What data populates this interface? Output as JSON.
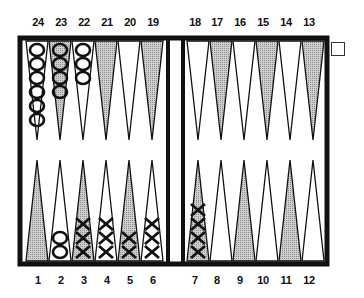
{
  "game": "backgammon",
  "colors": {
    "frame": "#111111",
    "shaded_point": "#b8b8b8",
    "light_point": "#ffffff",
    "checker_stroke": "#111111"
  },
  "top_labels": [
    "24",
    "23",
    "22",
    "21",
    "20",
    "19",
    "18",
    "17",
    "16",
    "15",
    "14",
    "13"
  ],
  "bottom_labels": [
    "1",
    "2",
    "3",
    "4",
    "5",
    "6",
    "7",
    "8",
    "9",
    "10",
    "11",
    "12"
  ],
  "points": {
    "1": {
      "shaded": true,
      "checkers": 0,
      "type": ""
    },
    "2": {
      "shaded": false,
      "checkers": 2,
      "type": "O"
    },
    "3": {
      "shaded": true,
      "checkers": 3,
      "type": "X"
    },
    "4": {
      "shaded": false,
      "checkers": 3,
      "type": "X"
    },
    "5": {
      "shaded": true,
      "checkers": 2,
      "type": "X"
    },
    "6": {
      "shaded": false,
      "checkers": 3,
      "type": "X"
    },
    "7": {
      "shaded": true,
      "checkers": 4,
      "type": "X"
    },
    "8": {
      "shaded": false,
      "checkers": 0,
      "type": ""
    },
    "9": {
      "shaded": true,
      "checkers": 0,
      "type": ""
    },
    "10": {
      "shaded": false,
      "checkers": 0,
      "type": ""
    },
    "11": {
      "shaded": true,
      "checkers": 0,
      "type": ""
    },
    "12": {
      "shaded": false,
      "checkers": 0,
      "type": ""
    },
    "13": {
      "shaded": true,
      "checkers": 0,
      "type": ""
    },
    "14": {
      "shaded": false,
      "checkers": 0,
      "type": ""
    },
    "15": {
      "shaded": true,
      "checkers": 0,
      "type": ""
    },
    "16": {
      "shaded": false,
      "checkers": 0,
      "type": ""
    },
    "17": {
      "shaded": true,
      "checkers": 0,
      "type": ""
    },
    "18": {
      "shaded": false,
      "checkers": 0,
      "type": ""
    },
    "19": {
      "shaded": true,
      "checkers": 0,
      "type": ""
    },
    "20": {
      "shaded": false,
      "checkers": 0,
      "type": ""
    },
    "21": {
      "shaded": true,
      "checkers": 0,
      "type": ""
    },
    "22": {
      "shaded": false,
      "checkers": 3,
      "type": "O"
    },
    "23": {
      "shaded": true,
      "checkers": 4,
      "type": "O"
    },
    "24": {
      "shaded": false,
      "checkers": 6,
      "type": "O"
    }
  },
  "checkbox": {
    "checked": false
  }
}
